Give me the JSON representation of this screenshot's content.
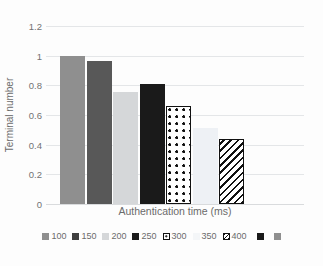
{
  "chart_data": {
    "type": "bar",
    "title": "",
    "subtitle": "",
    "xlabel": "Authentication time (ms)",
    "ylabel": "Terminal number",
    "categories": [
      "100",
      "150",
      "200",
      "250",
      "300",
      "350",
      "400"
    ],
    "values": [
      1.0,
      0.965,
      0.755,
      0.81,
      0.66,
      0.51,
      0.44
    ],
    "ylim": [
      0,
      1.2
    ],
    "ytick_labels": [
      "0",
      "0.2",
      "0.4",
      "0.6",
      "0.8",
      "1",
      "1.2"
    ],
    "ytick_values": [
      0,
      0.2,
      0.4,
      0.6,
      0.8,
      1,
      1.2
    ],
    "xtick_labels": [],
    "grid": "horizontal",
    "legend_position": "bottom",
    "series": [
      {
        "name": "Terminal number",
        "values": [
          1.0,
          0.965,
          0.755,
          0.81,
          0.66,
          0.51,
          0.44
        ]
      }
    ],
    "bar_styles": [
      {
        "category": "100",
        "fill": "#8f8f8f",
        "border": "none",
        "pattern": "solid"
      },
      {
        "category": "150",
        "fill": "#585858",
        "border": "none",
        "pattern": "solid"
      },
      {
        "category": "200",
        "fill": "#d5d7d9",
        "border": "none",
        "pattern": "solid"
      },
      {
        "category": "250",
        "fill": "#1a1a1a",
        "border": "none",
        "pattern": "solid"
      },
      {
        "category": "300",
        "fill": "#ffffff",
        "border": "#111111",
        "pattern": "dots"
      },
      {
        "category": "350",
        "fill": "#eef1f5",
        "border": "none",
        "pattern": "solid"
      },
      {
        "category": "400",
        "fill": "#ffffff",
        "border": "#111111",
        "pattern": "diagonal-stripes"
      }
    ]
  },
  "legend": {
    "entries": [
      {
        "label": "100",
        "color": "#8f8f8f",
        "pattern": "solid"
      },
      {
        "label": "150",
        "color": "#3f3f3f",
        "pattern": "solid"
      },
      {
        "label": "200",
        "color": "#d5d7d9",
        "pattern": "solid"
      },
      {
        "label": "250",
        "color": "#1a1a1a",
        "pattern": "solid"
      },
      {
        "label": "300",
        "color": "#ffffff",
        "pattern": "dots"
      },
      {
        "label": "350",
        "color": "#f4f6f8",
        "pattern": "solid"
      },
      {
        "label": "400",
        "color": "#ffffff",
        "pattern": "diagonal-stripes"
      },
      {
        "label": "",
        "color": "#1a1a1a",
        "pattern": "solid"
      },
      {
        "label": "",
        "color": "#8f8f8f",
        "pattern": "solid"
      }
    ]
  },
  "colors": {
    "background": "#fdfdfd",
    "gridline": "#e4e6e8",
    "axis_text": "#737373",
    "axis_title": "#6b6b6b"
  }
}
